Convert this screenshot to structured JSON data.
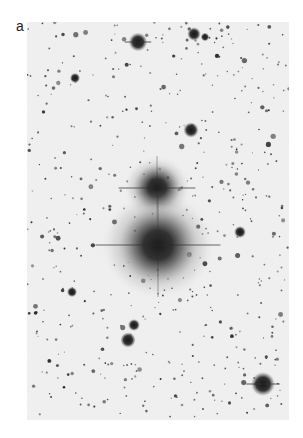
{
  "figure": {
    "panel_label": "a",
    "colors": {
      "page_background": "#ffffff",
      "plate_background": "#f1f1f1",
      "star_color": "#1e1e1e",
      "galaxy_core": "#1a1a1a"
    },
    "galaxies": [
      {
        "name": "upper-galaxy",
        "cx": 130,
        "cy": 166,
        "r_core": 16,
        "r_halo": 34
      },
      {
        "name": "lower-galaxy",
        "cx": 131,
        "cy": 223,
        "r_core": 26,
        "r_halo": 58
      }
    ],
    "bright_stars": [
      {
        "x": 111,
        "y": 20,
        "r": 5.5
      },
      {
        "x": 167,
        "y": 12,
        "r": 4
      },
      {
        "x": 178,
        "y": 15,
        "r": 2.5
      },
      {
        "x": 164,
        "y": 108,
        "r": 4.5
      },
      {
        "x": 236,
        "y": 362,
        "r": 7
      },
      {
        "x": 101,
        "y": 318,
        "r": 4.5
      },
      {
        "x": 107,
        "y": 303,
        "r": 3.5
      },
      {
        "x": 48,
        "y": 56,
        "r": 3
      },
      {
        "x": 45,
        "y": 270,
        "r": 3
      },
      {
        "x": 213,
        "y": 210,
        "r": 3.5
      }
    ]
  }
}
